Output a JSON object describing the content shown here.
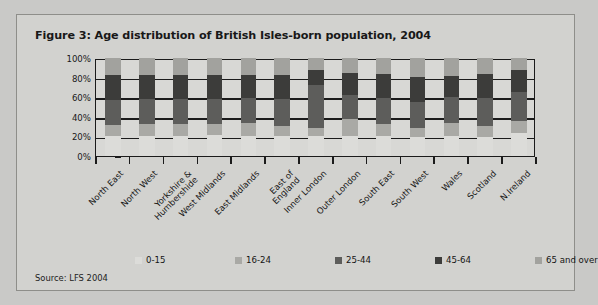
{
  "figure": {
    "title": "Figure 3: Age distribution of British Isles-born population, 2004",
    "source": "Source: LFS 2004"
  },
  "colors": {
    "background": "#c9c9c7",
    "card": "#d2d2cf",
    "plot": "#d8d8d5",
    "axis": "#1b1b1b",
    "series_0_15": "#dcdcd9",
    "series_16_24": "#a9a9a5",
    "series_25_44": "#5d5d5b",
    "series_45_64": "#3c3c3a",
    "series_65_over": "#a2a29e"
  },
  "axis": {
    "y_ticks": [
      "100%",
      "80%",
      "60%",
      "40%",
      "20%",
      "0%"
    ]
  },
  "legend": {
    "items": [
      {
        "label": "0-15",
        "color": "#dcdcd9"
      },
      {
        "label": "16-24",
        "color": "#a9a9a5"
      },
      {
        "label": "25-44",
        "color": "#5d5d5b"
      },
      {
        "label": "45-64",
        "color": "#3c3c3a"
      },
      {
        "label": "65 and over",
        "color": "#a2a29e"
      }
    ]
  },
  "chart_data": {
    "type": "bar",
    "stacked": true,
    "title": "Figure 3: Age distribution of British Isles-born population, 2004",
    "subtitle": "",
    "xlabel": "",
    "ylabel": "",
    "ylim": [
      0,
      100
    ],
    "yticks": [
      0,
      20,
      40,
      60,
      80,
      100
    ],
    "ytick_labels": [
      "0%",
      "20%",
      "40%",
      "60%",
      "80%",
      "100%"
    ],
    "grid": true,
    "legend_position": "bottom",
    "units": "percent",
    "categories": [
      "North East",
      "North West",
      "Yorkshire & Humbershide",
      "West Midlands",
      "East Midlands",
      "East of England",
      "Inner London",
      "Outer London",
      "South East",
      "South West",
      "Wales",
      "Scotland",
      "N.Ireland"
    ],
    "category_lines": [
      [
        "North East"
      ],
      [
        "North West"
      ],
      [
        "Yorkshire &",
        "Humbershide"
      ],
      [
        "West Midlands"
      ],
      [
        "East Midlands"
      ],
      [
        "East of",
        "England"
      ],
      [
        "Inner London"
      ],
      [
        "Outer London"
      ],
      [
        "South East"
      ],
      [
        "South West"
      ],
      [
        "Wales"
      ],
      [
        "Scotland"
      ],
      [
        "N.Ireland"
      ]
    ],
    "series": [
      {
        "name": "0-15",
        "color": "#dcdcd9",
        "values": [
          20,
          20,
          20,
          21,
          20,
          20,
          20,
          20,
          20,
          19,
          20,
          19,
          23
        ]
      },
      {
        "name": "16-24",
        "color": "#a9a9a5",
        "values": [
          12,
          13,
          13,
          12,
          14,
          11,
          9,
          18,
          13,
          10,
          14,
          12,
          13
        ]
      },
      {
        "name": "25-44",
        "color": "#5d5d5b",
        "values": [
          25,
          25,
          25,
          25,
          25,
          27,
          43,
          24,
          26,
          26,
          26,
          28,
          29
        ]
      },
      {
        "name": "45-64",
        "color": "#3c3c3a",
        "values": [
          26,
          25,
          25,
          25,
          24,
          25,
          16,
          23,
          25,
          26,
          22,
          25,
          23
        ]
      },
      {
        "name": "65 and over",
        "color": "#a2a29e",
        "values": [
          17,
          17,
          17,
          17,
          17,
          17,
          12,
          15,
          16,
          19,
          18,
          16,
          12
        ]
      }
    ],
    "cumulative_tops": [
      [
        20,
        32,
        57,
        83,
        100
      ],
      [
        20,
        33,
        58,
        83,
        100
      ],
      [
        20,
        33,
        58,
        83,
        100
      ],
      [
        21,
        33,
        58,
        83,
        100
      ],
      [
        20,
        34,
        59,
        83,
        100
      ],
      [
        20,
        31,
        58,
        83,
        100
      ],
      [
        20,
        29,
        72,
        88,
        100
      ],
      [
        20,
        38,
        62,
        85,
        100
      ],
      [
        20,
        33,
        59,
        84,
        100
      ],
      [
        19,
        29,
        55,
        81,
        100
      ],
      [
        20,
        34,
        60,
        82,
        100
      ],
      [
        19,
        31,
        59,
        84,
        100
      ],
      [
        23,
        36,
        65,
        88,
        100
      ]
    ]
  }
}
